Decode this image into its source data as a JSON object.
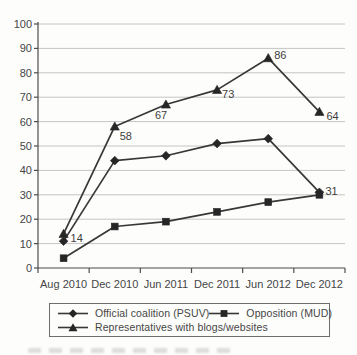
{
  "colors": {
    "background": "#fdfdfc",
    "line": "#383838",
    "marker": "#262626",
    "grid": "#c4c4c4",
    "axis": "#4d4d4d",
    "text": "#454545",
    "legend_border": "#6e6e6e"
  },
  "chart_data": {
    "type": "line",
    "categories": [
      "Aug 2010",
      "Dec 2010",
      "Jun 2011",
      "Dec 2011",
      "Jun 2012",
      "Dec 2012"
    ],
    "yticks": [
      0,
      10,
      20,
      30,
      40,
      50,
      60,
      70,
      80,
      90,
      100
    ],
    "ylim": [
      0,
      100
    ],
    "xlabel": "",
    "ylabel": "",
    "grid": "horizontal",
    "legend_position": "bottom-box",
    "series": [
      {
        "name": "Official coalition (PSUV)",
        "marker": "diamond",
        "values": [
          11,
          44,
          46,
          51,
          53,
          31
        ]
      },
      {
        "name": "Opposition (MUD)",
        "marker": "square",
        "values": [
          4,
          17,
          19,
          23,
          27,
          30
        ]
      },
      {
        "name": "Representatives with blogs/websites",
        "marker": "triangle",
        "values": [
          14,
          58,
          67,
          73,
          86,
          64
        ]
      }
    ],
    "point_labels": [
      {
        "s": 2,
        "i": 0,
        "text": "14",
        "dx": 7,
        "dy": 8
      },
      {
        "s": 2,
        "i": 1,
        "text": "58",
        "dx": 5,
        "dy": 14
      },
      {
        "s": 2,
        "i": 2,
        "text": "67",
        "dx": -11,
        "dy": 14
      },
      {
        "s": 2,
        "i": 3,
        "text": "73",
        "dx": 5,
        "dy": 8
      },
      {
        "s": 2,
        "i": 4,
        "text": "86",
        "dx": 6,
        "dy": 1
      },
      {
        "s": 2,
        "i": 5,
        "text": "64",
        "dx": 7,
        "dy": 8
      },
      {
        "s": 0,
        "i": 5,
        "text": "31",
        "dx": 6,
        "dy": 3
      }
    ]
  }
}
